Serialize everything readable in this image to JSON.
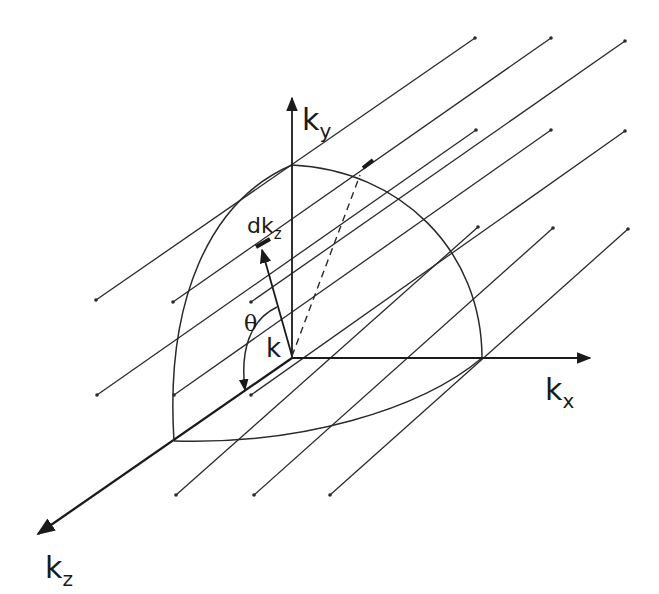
{
  "figure": {
    "colors": {
      "ink": "#1a1a1a",
      "background": "#ffffff"
    },
    "labels": {
      "ky": {
        "main": "k",
        "sub": "y"
      },
      "kx": {
        "main": "k",
        "sub": "x"
      },
      "kz": {
        "main": "k",
        "sub": "z"
      },
      "dkz": {
        "main": "dk",
        "sub": "z"
      },
      "k": "k",
      "theta": "θ"
    },
    "origin": [
      292,
      358
    ],
    "parallel_lines": [
      {
        "from": [
          96,
          300
        ],
        "to": [
          475,
          38
        ]
      },
      {
        "from": [
          173,
          302
        ],
        "to": [
          551,
          38
        ]
      },
      {
        "from": [
          251,
          302
        ],
        "to": [
          625,
          41
        ]
      },
      {
        "from": [
          97,
          395
        ],
        "to": [
          476,
          130
        ]
      },
      {
        "from": [
          174,
          395
        ],
        "to": [
          551,
          130
        ]
      },
      {
        "from": [
          251,
          395
        ],
        "to": [
          625,
          131
        ]
      },
      {
        "from": [
          176,
          495
        ],
        "to": [
          478,
          227
        ]
      },
      {
        "from": [
          254,
          495
        ],
        "to": [
          553,
          228
        ]
      },
      {
        "from": [
          330,
          495
        ],
        "to": [
          628,
          229
        ]
      }
    ]
  }
}
